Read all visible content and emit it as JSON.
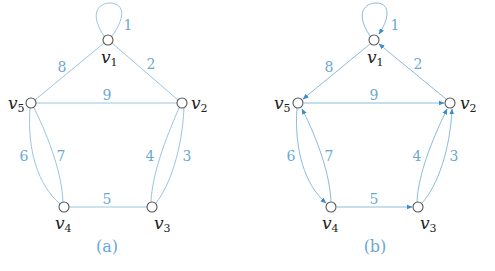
{
  "colors": {
    "edge": "#9cc5df",
    "edge_label": "#6aa8d4",
    "node_stroke": "#555555",
    "arrow": "#3d8cc7"
  },
  "graphs": [
    {
      "caption": "(a)",
      "directed": false,
      "vertices": [
        {
          "id": "v1",
          "name": "v",
          "sub": "1"
        },
        {
          "id": "v2",
          "name": "v",
          "sub": "2"
        },
        {
          "id": "v3",
          "name": "v",
          "sub": "3"
        },
        {
          "id": "v4",
          "name": "v",
          "sub": "4"
        },
        {
          "id": "v5",
          "name": "v",
          "sub": "5"
        }
      ],
      "edges": [
        {
          "label": "1",
          "from": "v1",
          "to": "v1"
        },
        {
          "label": "2",
          "from": "v1",
          "to": "v2"
        },
        {
          "label": "3",
          "from": "v2",
          "to": "v3"
        },
        {
          "label": "4",
          "from": "v2",
          "to": "v3"
        },
        {
          "label": "5",
          "from": "v3",
          "to": "v4"
        },
        {
          "label": "6",
          "from": "v4",
          "to": "v5"
        },
        {
          "label": "7",
          "from": "v4",
          "to": "v5"
        },
        {
          "label": "8",
          "from": "v1",
          "to": "v5"
        },
        {
          "label": "9",
          "from": "v2",
          "to": "v5"
        }
      ]
    },
    {
      "caption": "(b)",
      "directed": true,
      "vertices": [
        {
          "id": "v1",
          "name": "v",
          "sub": "1"
        },
        {
          "id": "v2",
          "name": "v",
          "sub": "2"
        },
        {
          "id": "v3",
          "name": "v",
          "sub": "3"
        },
        {
          "id": "v4",
          "name": "v",
          "sub": "4"
        },
        {
          "id": "v5",
          "name": "v",
          "sub": "5"
        }
      ],
      "edges": [
        {
          "label": "1",
          "from": "v1",
          "to": "v1"
        },
        {
          "label": "2",
          "from": "v2",
          "to": "v1"
        },
        {
          "label": "3",
          "from": "v3",
          "to": "v2"
        },
        {
          "label": "4",
          "from": "v3",
          "to": "v2"
        },
        {
          "label": "5",
          "from": "v4",
          "to": "v3"
        },
        {
          "label": "6",
          "from": "v5",
          "to": "v4"
        },
        {
          "label": "7",
          "from": "v4",
          "to": "v5"
        },
        {
          "label": "8",
          "from": "v1",
          "to": "v5"
        },
        {
          "label": "9",
          "from": "v5",
          "to": "v2"
        }
      ]
    }
  ]
}
